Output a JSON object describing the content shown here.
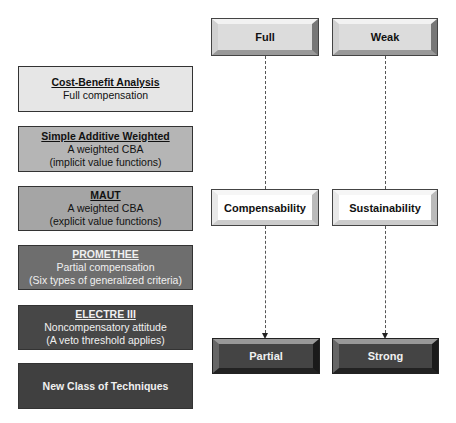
{
  "techniques": [
    {
      "title": "Cost-Benefit Analysis",
      "lines": [
        "Full compensation"
      ]
    },
    {
      "title": "Simple Additive Weighted",
      "lines": [
        "A weighted CBA",
        "(implicit value functions)"
      ]
    },
    {
      "title": "MAUT",
      "lines": [
        "A weighted CBA",
        "(explicit value functions)"
      ]
    },
    {
      "title": "PROMETHEE",
      "lines": [
        "Partial compensation",
        "(Six types of generalized criteria)"
      ]
    },
    {
      "title": "ELECTRE III",
      "lines": [
        "Noncompensatory attitude",
        "(A veto threshold applies)"
      ]
    },
    {
      "title": "New Class of Techniques",
      "lines": []
    }
  ],
  "columns": [
    {
      "top": "Full",
      "middle": "Compensability",
      "bottom": "Partial"
    },
    {
      "top": "Weak",
      "middle": "Sustainability",
      "bottom": "Strong"
    }
  ]
}
